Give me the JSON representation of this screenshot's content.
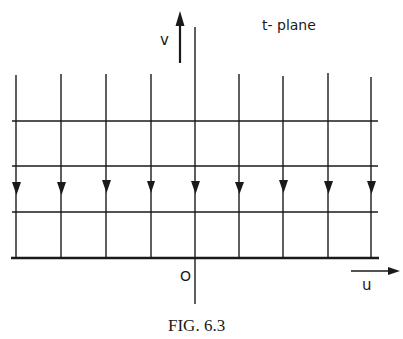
{
  "diagram": {
    "plane_label": "t- plane",
    "v_axis_label": "v",
    "u_axis_label": "u",
    "origin_label": "O",
    "caption": "FIG. 6.3",
    "colors": {
      "ink": "#1a1a1a",
      "background": "#ffffff"
    },
    "grid": {
      "vertical_lines_x": [
        16,
        61,
        106,
        151,
        195,
        239,
        283,
        328,
        371
      ],
      "horizontal_lines_y": [
        121,
        166,
        212
      ],
      "baseline_y": 258,
      "flow_direction": "downward"
    }
  }
}
